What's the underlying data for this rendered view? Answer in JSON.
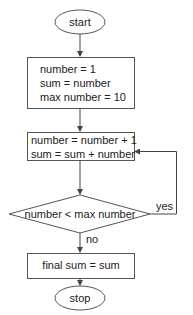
{
  "flowchart": {
    "start": {
      "label": "start"
    },
    "init_box": {
      "lines": [
        "number = 1",
        "sum = number",
        "max number = 10"
      ]
    },
    "loop_box": {
      "lines": [
        "number = number + 1",
        "sum = sum + number"
      ]
    },
    "decision": {
      "label": "number < max number",
      "yes_label": "yes",
      "no_label": "no"
    },
    "final_box": {
      "label": "final sum = sum"
    },
    "stop": {
      "label": "stop"
    }
  },
  "colors": {
    "stroke": "#555555",
    "text": "#222222",
    "background": "#ffffff"
  }
}
